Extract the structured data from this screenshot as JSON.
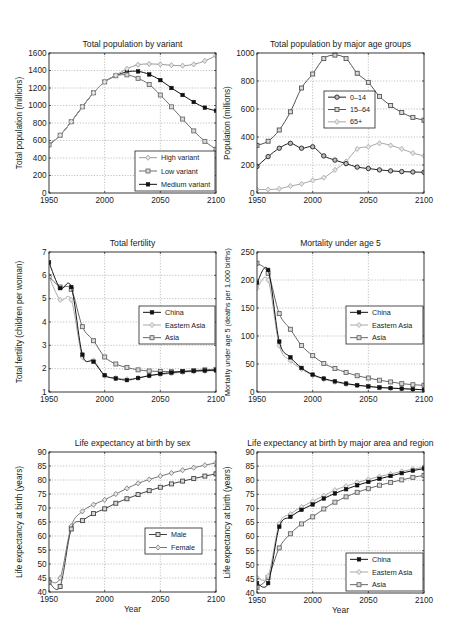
{
  "figure": {
    "panels": 6
  },
  "chart_data": [
    {
      "id": "pop-variant",
      "type": "line",
      "title": "Total population by variant",
      "xlabel": "",
      "ylabel": "Total population (millions)",
      "xlim": [
        1950,
        2100
      ],
      "ylim": [
        0,
        1600
      ],
      "xticks": [
        1950,
        2000,
        2050,
        2100
      ],
      "yticks": [
        0,
        200,
        400,
        600,
        800,
        1000,
        1200,
        1400,
        1600
      ],
      "grid": true,
      "box": {
        "x": 49,
        "y": 53,
        "w": 167,
        "h": 140
      },
      "legend": {
        "x": 135,
        "y": 151,
        "w": 80,
        "h": 40,
        "position": "lower right"
      },
      "x": [
        1950,
        1960,
        1970,
        1980,
        1990,
        2000,
        2010,
        2020,
        2030,
        2040,
        2050,
        2060,
        2070,
        2080,
        2090,
        2100
      ],
      "series": [
        {
          "name": "High variant",
          "color": "#9a9a9a",
          "marker": "diamond",
          "values": [
            550,
            660,
            815,
            985,
            1145,
            1270,
            1345,
            1420,
            1465,
            1475,
            1470,
            1460,
            1455,
            1470,
            1510,
            1570
          ]
        },
        {
          "name": "Low variant",
          "color": "#6e6e6e",
          "marker": "square",
          "values": [
            550,
            660,
            815,
            985,
            1145,
            1270,
            1340,
            1350,
            1310,
            1240,
            1120,
            985,
            845,
            710,
            590,
            500
          ]
        },
        {
          "name": "Medium variant",
          "color": "#111111",
          "marker": "dot",
          "values": [
            550,
            660,
            815,
            985,
            1145,
            1270,
            1340,
            1385,
            1390,
            1355,
            1290,
            1200,
            1120,
            1040,
            975,
            940
          ]
        }
      ]
    },
    {
      "id": "pop-age",
      "type": "line",
      "title": "Total population by major age groups",
      "xlabel": "",
      "ylabel": "Population (millions)",
      "xlim": [
        1950,
        2100
      ],
      "ylim": [
        0,
        1000
      ],
      "xticks": [
        1950,
        2000,
        2050,
        2100
      ],
      "yticks": [
        0,
        200,
        400,
        600,
        800,
        1000
      ],
      "grid": true,
      "box": {
        "x": 257,
        "y": 53,
        "w": 167,
        "h": 140
      },
      "legend": {
        "x": 324,
        "y": 91,
        "w": 51,
        "h": 37,
        "position": "center"
      },
      "x": [
        1950,
        1960,
        1970,
        1980,
        1990,
        2000,
        2010,
        2020,
        2030,
        2040,
        2050,
        2060,
        2070,
        2080,
        2090,
        2100
      ],
      "series": [
        {
          "name": "0–14",
          "color": "#222222",
          "marker": "circle",
          "values": [
            190,
            260,
            320,
            355,
            320,
            330,
            265,
            235,
            210,
            185,
            175,
            165,
            158,
            153,
            150,
            148
          ]
        },
        {
          "name": "15–64",
          "color": "#555555",
          "marker": "square",
          "values": [
            340,
            370,
            450,
            580,
            750,
            850,
            960,
            985,
            960,
            855,
            790,
            690,
            625,
            575,
            540,
            520
          ]
        },
        {
          "name": "65+",
          "color": "#a8a8a8",
          "marker": "diamond",
          "values": [
            25,
            25,
            30,
            50,
            65,
            90,
            110,
            165,
            225,
            315,
            330,
            355,
            340,
            315,
            285,
            265
          ]
        }
      ]
    },
    {
      "id": "fertility",
      "type": "line",
      "title": "Total fertility",
      "xlabel": "",
      "ylabel": "Total fertility (children per woman)",
      "xlim": [
        1950,
        2100
      ],
      "ylim": [
        1,
        7
      ],
      "xticks": [
        1950,
        2000,
        2050,
        2100
      ],
      "yticks": [
        1,
        2,
        3,
        4,
        5,
        6,
        7
      ],
      "grid": true,
      "box": {
        "x": 49,
        "y": 252,
        "w": 167,
        "h": 140
      },
      "legend": {
        "x": 139,
        "y": 306,
        "w": 76,
        "h": 38,
        "position": "center right"
      },
      "x": [
        1950,
        1960,
        1970,
        1980,
        1990,
        2000,
        2010,
        2020,
        2030,
        2040,
        2050,
        2060,
        2070,
        2080,
        2090,
        2100
      ],
      "series": [
        {
          "name": "China",
          "color": "#111111",
          "marker": "dot",
          "values": [
            6.55,
            5.45,
            5.5,
            2.6,
            2.3,
            1.72,
            1.58,
            1.51,
            1.6,
            1.7,
            1.78,
            1.83,
            1.88,
            1.9,
            1.92,
            1.93
          ]
        },
        {
          "name": "Eastern Asia",
          "color": "#a8a8a8",
          "marker": "diamond",
          "values": [
            5.95,
            4.95,
            4.95,
            2.5,
            2.35,
            1.7,
            1.6,
            1.55,
            1.6,
            1.7,
            1.75,
            1.8,
            1.85,
            1.88,
            1.9,
            1.92
          ]
        },
        {
          "name": "Asia",
          "color": "#666666",
          "marker": "square",
          "values": [
            5.95,
            5.5,
            5.4,
            3.8,
            3.2,
            2.5,
            2.2,
            2.05,
            1.95,
            1.9,
            1.88,
            1.87,
            1.88,
            1.92,
            1.95,
            1.97
          ]
        }
      ]
    },
    {
      "id": "mortality",
      "type": "line",
      "title": "Mortality under age 5",
      "xlabel": "",
      "ylabel": "Mortality under age 5 (deaths per 1,000 births)",
      "xlim": [
        1950,
        2100
      ],
      "ylim": [
        0,
        250
      ],
      "xticks": [
        1950,
        2000,
        2050,
        2100
      ],
      "yticks": [
        0,
        50,
        100,
        150,
        200,
        250
      ],
      "grid": true,
      "box": {
        "x": 257,
        "y": 252,
        "w": 167,
        "h": 140
      },
      "legend": {
        "x": 346,
        "y": 306,
        "w": 77,
        "h": 38,
        "position": "center right"
      },
      "x": [
        1950,
        1960,
        1970,
        1980,
        1990,
        2000,
        2010,
        2020,
        2030,
        2040,
        2050,
        2060,
        2070,
        2080,
        2090,
        2100
      ],
      "series": [
        {
          "name": "China",
          "color": "#111111",
          "marker": "dot",
          "values": [
            195,
            218,
            90,
            62,
            43,
            31,
            24,
            19,
            15,
            12,
            10,
            8,
            7,
            6,
            5,
            4
          ]
        },
        {
          "name": "Eastern Asia",
          "color": "#a8a8a8",
          "marker": "diamond",
          "values": [
            185,
            200,
            83,
            56,
            41,
            30,
            23,
            18,
            14,
            12,
            10,
            8,
            7,
            6,
            5,
            4
          ]
        },
        {
          "name": "Asia",
          "color": "#666666",
          "marker": "square",
          "values": [
            230,
            212,
            140,
            112,
            83,
            65,
            51,
            42,
            35,
            29,
            25,
            21,
            18,
            15,
            13,
            12
          ]
        }
      ]
    },
    {
      "id": "life-sex",
      "type": "line",
      "title": "Life expectancy at birth by sex",
      "xlabel": "Year",
      "ylabel": "Life expectancy at birth (years)",
      "xlim": [
        1950,
        2100
      ],
      "ylim": [
        40,
        90
      ],
      "xticks": [
        1950,
        2000,
        2050,
        2100
      ],
      "yticks": [
        40,
        45,
        50,
        55,
        60,
        65,
        70,
        75,
        80,
        85,
        90
      ],
      "grid": true,
      "box": {
        "x": 49,
        "y": 452,
        "w": 167,
        "h": 140
      },
      "legend": {
        "x": 145,
        "y": 528,
        "w": 57,
        "h": 26,
        "position": "center right"
      },
      "x": [
        1950,
        1960,
        1970,
        1980,
        1990,
        2000,
        2010,
        2020,
        2030,
        2040,
        2050,
        2060,
        2070,
        2080,
        2090,
        2100
      ],
      "series": [
        {
          "name": "Male",
          "color": "#444444",
          "marker": "square",
          "values": [
            43.5,
            42.0,
            62.5,
            65.5,
            68.0,
            69.7,
            71.7,
            73.3,
            74.8,
            76.2,
            77.4,
            78.6,
            79.6,
            80.5,
            81.4,
            82.2
          ]
        },
        {
          "name": "Female",
          "color": "#777777",
          "marker": "diamond",
          "values": [
            44.0,
            45.0,
            63.5,
            68.8,
            71.2,
            72.9,
            75.0,
            77.0,
            78.8,
            80.2,
            81.4,
            82.5,
            83.5,
            84.4,
            85.3,
            86.1
          ]
        }
      ]
    },
    {
      "id": "life-region",
      "type": "line",
      "title": "Life expectancy at birth by major area and region",
      "xlabel": "Year",
      "ylabel": "Life expectancy at birth (years)",
      "xlim": [
        1950,
        2100
      ],
      "ylim": [
        40,
        90
      ],
      "xticks": [
        1950,
        2000,
        2050,
        2100
      ],
      "yticks": [
        40,
        45,
        50,
        55,
        60,
        65,
        70,
        75,
        80,
        85,
        90
      ],
      "grid": true,
      "box": {
        "x": 257,
        "y": 452,
        "w": 167,
        "h": 141
      },
      "legend": {
        "x": 346,
        "y": 553,
        "w": 77,
        "h": 38,
        "position": "lower right"
      },
      "x": [
        1950,
        1960,
        1970,
        1980,
        1990,
        2000,
        2010,
        2020,
        2030,
        2040,
        2050,
        2060,
        2070,
        2080,
        2090,
        2100
      ],
      "series": [
        {
          "name": "China",
          "color": "#111111",
          "marker": "dot",
          "values": [
            43.5,
            43.5,
            63.5,
            67.0,
            69.5,
            71.4,
            73.5,
            75.3,
            76.8,
            78.2,
            79.4,
            80.5,
            81.5,
            82.5,
            83.4,
            84.1
          ]
        },
        {
          "name": "Eastern Asia",
          "color": "#a8a8a8",
          "marker": "diamond",
          "values": [
            45.5,
            46.0,
            64.5,
            68.0,
            70.5,
            72.5,
            74.5,
            76.5,
            77.9,
            79.2,
            80.3,
            81.3,
            82.2,
            83.1,
            83.9,
            84.6
          ]
        },
        {
          "name": "Asia",
          "color": "#666666",
          "marker": "square",
          "values": [
            42.0,
            45.5,
            56.0,
            61.0,
            64.5,
            67.0,
            69.8,
            72.2,
            74.1,
            75.7,
            77.0,
            78.2,
            79.2,
            80.1,
            81.0,
            81.7
          ]
        }
      ]
    }
  ]
}
